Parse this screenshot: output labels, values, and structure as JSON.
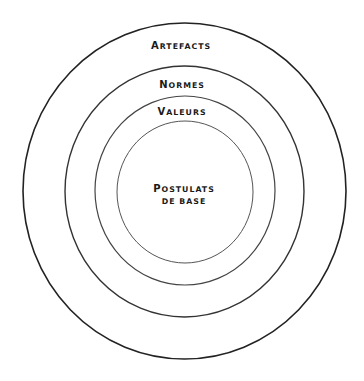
{
  "diagram": {
    "type": "concentric-circles",
    "title": "",
    "layers": [
      {
        "id": "artefacts",
        "first": "A",
        "rest": "RTEFACTS",
        "full": "Artefacts",
        "cx": 184.5,
        "cy": 191,
        "rx": 161.5,
        "ry": 168,
        "stroke": "#222222",
        "stroke_width": 1.6
      },
      {
        "id": "normes",
        "first": "N",
        "rest": "ORMES",
        "full": "Normes",
        "cx": 184.5,
        "cy": 191.5,
        "rx": 119.5,
        "ry": 125.5,
        "stroke": "#333333",
        "stroke_width": 1.4
      },
      {
        "id": "valeurs",
        "first": "V",
        "rest": "ALEURS",
        "full": "Valeurs",
        "cx": 185,
        "cy": 190.5,
        "rx": 90,
        "ry": 94.5,
        "stroke": "#444444",
        "stroke_width": 1.2
      },
      {
        "id": "postulats",
        "first": "P",
        "rest": "OSTULATS",
        "line2": "DE BASE",
        "full": "Postulats de base",
        "cx": 185,
        "cy": 192,
        "rx": 68,
        "ry": 71,
        "stroke": "#555555",
        "stroke_width": 1.0
      }
    ],
    "labels": {
      "artefacts": "Artefacts",
      "normes": "Normes",
      "valeurs": "Valeurs",
      "postulats_line1": "Postulats",
      "postulats_line2": "de base"
    }
  }
}
